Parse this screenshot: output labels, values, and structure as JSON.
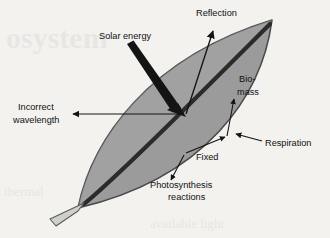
{
  "figure": {
    "background_color": "#f3f2ef",
    "leaf_fill_color": "#9b9b9b",
    "leaf_outline_color": "#4a4a4a",
    "midrib_color": "#2b2b2b",
    "stem_fill_color": "#cfcfcb",
    "arrow_color": "#141414",
    "label_color": "#111111"
  },
  "labels": {
    "solar_energy": "Solar energy",
    "reflection": "Reflection",
    "biomass_line1": "Bio-",
    "biomass_line2": "mass",
    "respiration": "Respiration",
    "fixed": "Fixed",
    "photosynthesis_line1": "Photosynthesis",
    "photosynthesis_line2": "reactions",
    "incorrect_line1": "Incorrect",
    "incorrect_line2": "wavelength"
  },
  "background_ghost": {
    "word": "osystem",
    "line_a": "thermal",
    "line_b": "available light"
  },
  "geometry": {
    "leaf_tip_x": 272,
    "leaf_tip_y": 20,
    "leaf_base_x": 78,
    "leaf_base_y": 208,
    "junction_x": 185,
    "junction_y": 115,
    "fixed_junction_x": 228,
    "fixed_junction_y": 139
  }
}
